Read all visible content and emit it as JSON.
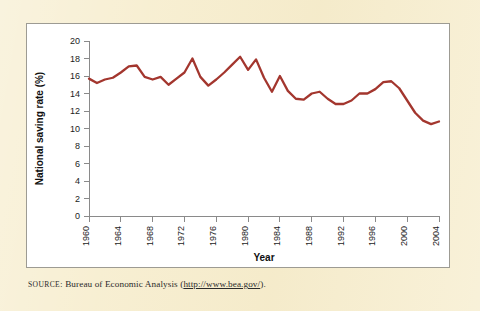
{
  "figure": {
    "background_color": "#f7eed0",
    "panel_color": "#ffffff",
    "panel_border_color": "#9d9b93"
  },
  "source": {
    "label": "SOURCE",
    "separator": ": ",
    "agency": "Bureau of Economic Analysis ",
    "open_paren": "(",
    "url": "http://www.bea.gov/",
    "close_paren": ").",
    "full_text": "SOURCE: Bureau of Economic Analysis (http://www.bea.gov/)."
  },
  "chart_data": {
    "type": "line",
    "title": "",
    "xlabel": "Year",
    "ylabel": "National saving rate (%)",
    "xlim": [
      1960,
      2004
    ],
    "ylim": [
      0,
      20
    ],
    "grid": false,
    "legend": "none",
    "line_color": "#a3362e",
    "y_ticks": [
      0,
      2,
      4,
      6,
      8,
      10,
      12,
      14,
      16,
      18,
      20
    ],
    "y_tick_labels": [
      "0",
      "2",
      "4",
      "6",
      "8",
      "10",
      "12",
      "14",
      "16",
      "18",
      "20"
    ],
    "x_ticks": [
      1960,
      1964,
      1968,
      1972,
      1976,
      1980,
      1984,
      1988,
      1992,
      1996,
      2000,
      2004
    ],
    "x_tick_labels": [
      "1960",
      "1964",
      "1968",
      "1972",
      "1976",
      "1980",
      "1984",
      "1988",
      "1992",
      "1996",
      "2000",
      "2004"
    ],
    "x_tick_rotation": 90,
    "x": [
      1960,
      1961,
      1962,
      1963,
      1964,
      1965,
      1966,
      1967,
      1968,
      1969,
      1970,
      1971,
      1972,
      1973,
      1974,
      1975,
      1976,
      1977,
      1978,
      1979,
      1980,
      1981,
      1982,
      1983,
      1984,
      1985,
      1986,
      1987,
      1988,
      1989,
      1990,
      1991,
      1992,
      1993,
      1994,
      1995,
      1996,
      1997,
      1998,
      1999,
      2000,
      2001,
      2002,
      2003,
      2004
    ],
    "values": [
      15.7,
      15.2,
      15.6,
      15.8,
      16.4,
      17.1,
      17.2,
      15.9,
      15.6,
      15.9,
      15.0,
      15.7,
      16.4,
      18.0,
      15.9,
      14.9,
      15.6,
      16.4,
      17.3,
      18.2,
      16.7,
      17.9,
      15.8,
      14.2,
      16.0,
      14.3,
      13.4,
      13.3,
      14.0,
      14.2,
      13.4,
      12.8,
      12.8,
      13.2,
      14.0,
      14.0,
      14.5,
      15.3,
      15.4,
      14.6,
      13.2,
      11.8,
      10.9,
      10.5,
      10.8
    ],
    "series": [
      {
        "name": "National saving rate",
        "values": [
          15.7,
          15.2,
          15.6,
          15.8,
          16.4,
          17.1,
          17.2,
          15.9,
          15.6,
          15.9,
          15.0,
          15.7,
          16.4,
          18.0,
          15.9,
          14.9,
          15.6,
          16.4,
          17.3,
          18.2,
          16.7,
          17.9,
          15.8,
          14.2,
          16.0,
          14.3,
          13.4,
          13.3,
          14.0,
          14.2,
          13.4,
          12.8,
          12.8,
          13.2,
          14.0,
          14.0,
          14.5,
          15.3,
          15.4,
          14.6,
          13.2,
          11.8,
          10.9,
          10.5,
          10.8
        ]
      }
    ]
  }
}
